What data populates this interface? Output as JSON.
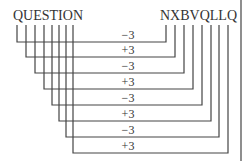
{
  "diagram": {
    "plain_word": "QUESTION",
    "cipher_word": "NXBVQLLQ",
    "shifts": [
      "−3",
      "+3",
      "−3",
      "+3",
      "−3",
      "+3",
      "−3",
      "+3"
    ],
    "mappings": [
      {
        "from": "Q",
        "to": "N",
        "shift": "−3"
      },
      {
        "from": "U",
        "to": "X",
        "shift": "+3"
      },
      {
        "from": "E",
        "to": "B",
        "shift": "−3"
      },
      {
        "from": "S",
        "to": "V",
        "shift": "+3"
      },
      {
        "from": "T",
        "to": "Q",
        "shift": "−3"
      },
      {
        "from": "I",
        "to": "L",
        "shift": "+3"
      },
      {
        "from": "O",
        "to": "L",
        "shift": "−3"
      },
      {
        "from": "N",
        "to": "Q",
        "shift": "+3"
      }
    ],
    "line_color": "#444444"
  }
}
